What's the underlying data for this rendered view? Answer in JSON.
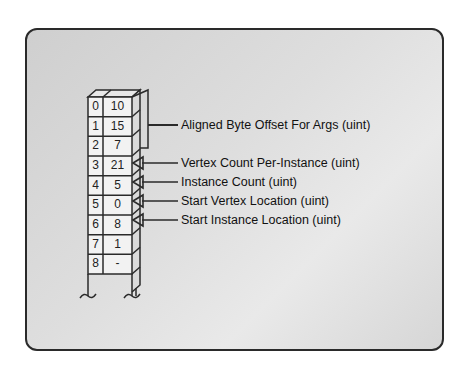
{
  "diagram": {
    "type": "buffer-layout",
    "rows": [
      {
        "index": "0",
        "value": "10"
      },
      {
        "index": "1",
        "value": "15"
      },
      {
        "index": "2",
        "value": "7"
      },
      {
        "index": "3",
        "value": "21"
      },
      {
        "index": "4",
        "value": "5"
      },
      {
        "index": "5",
        "value": "0"
      },
      {
        "index": "6",
        "value": "8"
      },
      {
        "index": "7",
        "value": "1"
      },
      {
        "index": "8",
        "value": "-"
      }
    ],
    "labels": {
      "offset": "Aligned Byte Offset For Args (uint)",
      "vertex_count": "Vertex Count Per-Instance (uint)",
      "instance_count": "Instance Count (uint)",
      "start_vertex": "Start Vertex Location (uint)",
      "start_instance": "Start Instance Location (uint)"
    }
  }
}
